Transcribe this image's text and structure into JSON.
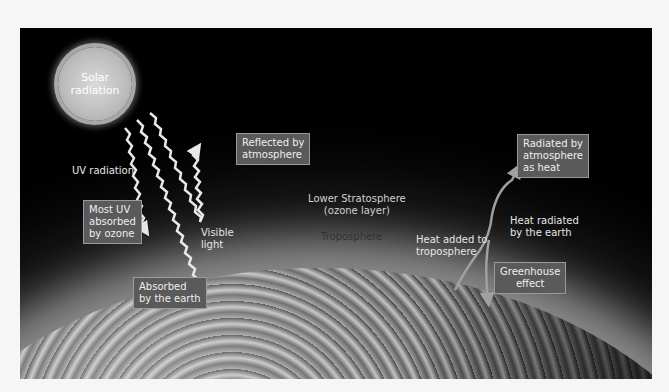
{
  "diagram": {
    "sun_label": "Solar radiation",
    "sun_line1": "Solar",
    "sun_line2": "radiation",
    "boxes": {
      "reflected": [
        "Reflected by",
        "atmosphere"
      ],
      "most_uv": [
        "Most UV",
        "absorbed",
        "by ozone"
      ],
      "absorbed_earth": [
        "Absorbed",
        "by the earth"
      ],
      "radiated_atmosphere": [
        "Radiated by",
        "atmosphere",
        "as heat"
      ],
      "greenhouse": [
        "Greenhouse",
        "effect"
      ]
    },
    "labels": {
      "uv_radiation": "UV radiation",
      "visible_light": [
        "Visible",
        "light"
      ],
      "lower_stratosphere": [
        "Lower Stratosphere",
        "(ozone layer)"
      ],
      "troposphere": "Troposphere",
      "heat_added": [
        "Heat added to",
        "troposphere"
      ],
      "heat_radiated": [
        "Heat radiated",
        "by the earth"
      ]
    },
    "colors": {
      "background": "#000000",
      "page": "#f6f6f6",
      "box_fill": "#5a5a5a",
      "box_border": "#9a9a9a",
      "arrow": "#e8e8e8",
      "heat_arrow": "#a0a0a0"
    }
  }
}
